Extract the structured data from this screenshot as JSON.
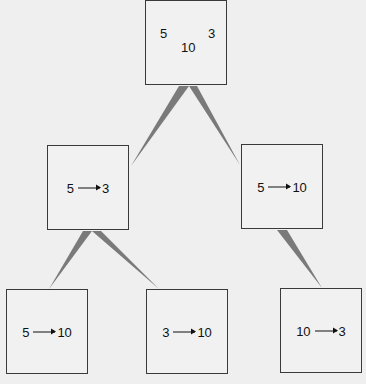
{
  "diagram": {
    "type": "tree",
    "colors": {
      "background": "#efefef",
      "box_border": "#3a3a3a",
      "connector": "#7a7a7a",
      "text": "#111111"
    },
    "root": {
      "values": [
        "5",
        "3",
        "10"
      ],
      "left_value": "5",
      "right_value": "3",
      "bottom_value": "10"
    },
    "level1": [
      {
        "from": "5",
        "to": "3"
      },
      {
        "from": "5",
        "to": "10"
      }
    ],
    "level2": [
      {
        "parent": "5→3",
        "from": "5",
        "to": "10"
      },
      {
        "parent": "5→3",
        "from": "3",
        "to": "10"
      },
      {
        "parent": "5→10",
        "from": "10",
        "to": "3"
      }
    ]
  }
}
